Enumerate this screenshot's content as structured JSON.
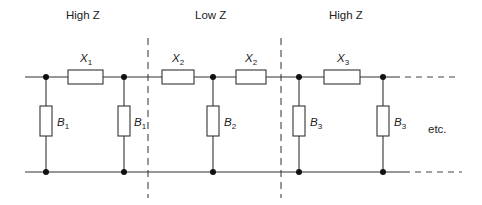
{
  "diagram": {
    "type": "ladder-network-circuit",
    "regions": [
      {
        "label": "High Z",
        "x": 83
      },
      {
        "label": "Low Z",
        "x": 210
      },
      {
        "label": "High Z",
        "x": 348
      }
    ],
    "series_elements": [
      {
        "symbol": "X",
        "sub": "1",
        "x1": 68,
        "x2": 103
      },
      {
        "symbol": "X",
        "sub": "2",
        "x1": 162,
        "x2": 194
      },
      {
        "symbol": "X",
        "sub": "2",
        "x1": 236,
        "x2": 266
      },
      {
        "symbol": "X",
        "sub": "3",
        "x1": 324,
        "x2": 360
      }
    ],
    "shunt_elements": [
      {
        "symbol": "B",
        "sub": "1",
        "x": 46
      },
      {
        "symbol": "B",
        "sub": "1",
        "x": 124
      },
      {
        "symbol": "B",
        "sub": "2",
        "x": 213
      },
      {
        "symbol": "B",
        "sub": "3",
        "x": 299
      },
      {
        "symbol": "B",
        "sub": "3",
        "x": 383
      }
    ],
    "section_dividers": [
      148,
      281
    ],
    "continuation_label": "etc.",
    "colors": {
      "line": "#333333",
      "node": "#111111",
      "background": "#ffffff"
    }
  }
}
